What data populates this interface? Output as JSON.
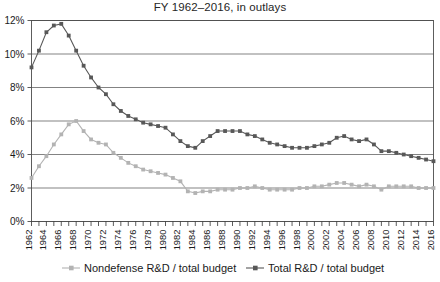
{
  "chart_data": {
    "type": "line",
    "title": "FY 1962–2016, in outlays",
    "xlabel": "",
    "ylabel": "",
    "ylim": [
      0,
      12
    ],
    "ytick_labels": [
      "0%",
      "2%",
      "4%",
      "6%",
      "8%",
      "10%",
      "12%"
    ],
    "ytick_values": [
      0,
      2,
      4,
      6,
      8,
      10,
      12
    ],
    "grid": true,
    "legend_position": "bottom",
    "x": [
      1962,
      1963,
      1964,
      1965,
      1966,
      1967,
      1968,
      1969,
      1970,
      1971,
      1972,
      1973,
      1974,
      1975,
      1976,
      1977,
      1978,
      1979,
      1980,
      1981,
      1982,
      1983,
      1984,
      1985,
      1986,
      1987,
      1988,
      1989,
      1990,
      1991,
      1992,
      1993,
      1994,
      1995,
      1996,
      1997,
      1998,
      1999,
      2000,
      2001,
      2002,
      2003,
      2004,
      2005,
      2006,
      2007,
      2008,
      2009,
      2010,
      2011,
      2012,
      2013,
      2014,
      2015,
      2016
    ],
    "xtick_labels": [
      "1962",
      "1964",
      "1966",
      "1968",
      "1970",
      "1972",
      "1974",
      "1976",
      "1978",
      "1980",
      "1982",
      "1984",
      "1986",
      "1988",
      "1990",
      "1992",
      "1994",
      "1996",
      "1998",
      "2000",
      "2002",
      "2004",
      "2006",
      "2008",
      "2010",
      "2012",
      "2014",
      "2016"
    ],
    "series": [
      {
        "name": "Total R&D / total budget",
        "color": "#585858",
        "marker": "square",
        "values": [
          9.2,
          10.2,
          11.3,
          11.7,
          11.8,
          11.1,
          10.2,
          9.3,
          8.6,
          8.0,
          7.6,
          7.0,
          6.6,
          6.3,
          6.1,
          5.9,
          5.8,
          5.7,
          5.6,
          5.2,
          4.8,
          4.5,
          4.4,
          4.8,
          5.1,
          5.4,
          5.4,
          5.4,
          5.4,
          5.2,
          5.1,
          4.9,
          4.7,
          4.6,
          4.5,
          4.4,
          4.4,
          4.4,
          4.5,
          4.6,
          4.7,
          5.0,
          5.1,
          4.9,
          4.8,
          4.9,
          4.6,
          4.2,
          4.2,
          4.1,
          4.0,
          3.9,
          3.8,
          3.7,
          3.6
        ]
      },
      {
        "name": "Nondefense R&D / total budget",
        "color": "#b3b3b3",
        "marker": "square",
        "values": [
          2.6,
          3.3,
          3.9,
          4.6,
          5.2,
          5.8,
          6.0,
          5.4,
          4.9,
          4.7,
          4.6,
          4.1,
          3.8,
          3.5,
          3.3,
          3.1,
          3.0,
          2.9,
          2.8,
          2.6,
          2.4,
          1.8,
          1.7,
          1.8,
          1.8,
          1.9,
          1.9,
          1.9,
          2.0,
          2.0,
          2.1,
          2.0,
          1.9,
          1.9,
          1.9,
          1.9,
          2.0,
          2.0,
          2.1,
          2.1,
          2.2,
          2.3,
          2.3,
          2.2,
          2.1,
          2.2,
          2.1,
          1.9,
          2.1,
          2.1,
          2.1,
          2.1,
          2.0,
          2.0,
          2.0
        ]
      }
    ]
  },
  "legend": {
    "items": [
      {
        "label": "Nondefense R&D / total budget",
        "color": "#b3b3b3"
      },
      {
        "label": "Total R&D / total budget",
        "color": "#585858"
      }
    ]
  },
  "colors": {
    "nondefense": "#b3b3b3",
    "total": "#585858",
    "grid": "#4d4d4d",
    "axis": "#333333",
    "background": "#ffffff"
  }
}
